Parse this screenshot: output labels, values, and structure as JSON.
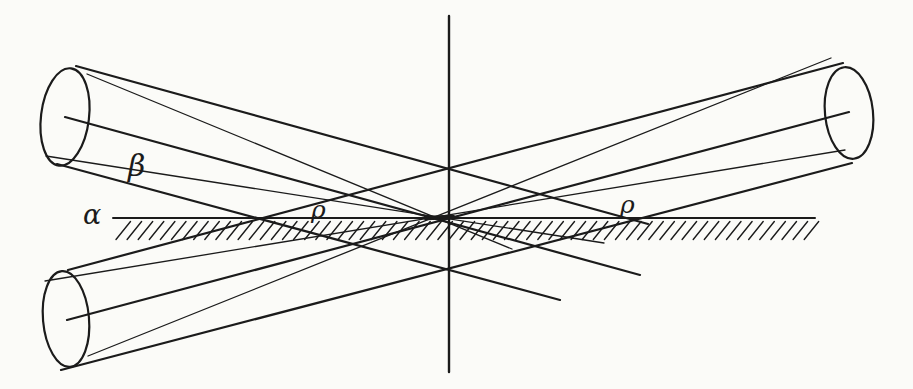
{
  "figure": {
    "background_color": "#fbfbf8",
    "ink_color": "#1b1b1b",
    "labels": {
      "alpha": "α",
      "beta": "β",
      "rho_left": "ρ",
      "rho_right": "ρ"
    },
    "canvas": {
      "width": 913,
      "height": 389
    },
    "lines": [
      {
        "id": "vertical-axis-line",
        "x1": 449,
        "y1": 16,
        "x2": 449,
        "y2": 372,
        "w": 2.4
      },
      {
        "id": "surface-line",
        "x1": 113,
        "y1": 218,
        "x2": 815,
        "y2": 218,
        "w": 2.0
      },
      {
        "id": "focus-segment",
        "x1": 426,
        "y1": 218,
        "x2": 453,
        "y2": 217,
        "w": 4.5
      },
      {
        "id": "beam1-top-edge",
        "x1": 76,
        "y1": 66,
        "x2": 648,
        "y2": 224,
        "w": 2.2
      },
      {
        "id": "beam1-axis",
        "x1": 65,
        "y1": 117,
        "x2": 640,
        "y2": 275,
        "w": 2.2
      },
      {
        "id": "beam1-bottom-edge",
        "x1": 57,
        "y1": 164,
        "x2": 560,
        "y2": 300,
        "w": 2.2
      },
      {
        "id": "beam1-ray-top",
        "x1": 87,
        "y1": 74,
        "x2": 512,
        "y2": 249,
        "w": 1.3
      },
      {
        "id": "beam1-ray-bottom",
        "x1": 46,
        "y1": 156,
        "x2": 604,
        "y2": 243,
        "w": 1.3
      },
      {
        "id": "beam2-top-edge",
        "x1": 68,
        "y1": 270,
        "x2": 843,
        "y2": 63,
        "w": 2.2
      },
      {
        "id": "beam2-axis",
        "x1": 67,
        "y1": 320,
        "x2": 849,
        "y2": 112,
        "w": 2.2
      },
      {
        "id": "beam2-bottom-edge",
        "x1": 61,
        "y1": 370,
        "x2": 852,
        "y2": 163,
        "w": 2.2
      },
      {
        "id": "beam2-ray-steep",
        "x1": 88,
        "y1": 356,
        "x2": 831,
        "y2": 58,
        "w": 1.3
      },
      {
        "id": "beam2-ray-shallow",
        "x1": 45,
        "y1": 281,
        "x2": 845,
        "y2": 150,
        "w": 1.3
      }
    ],
    "ellipses": [
      {
        "id": "upper-left-beam-cap",
        "cx": 65,
        "cy": 117,
        "rx": 24,
        "ry": 49,
        "rot": 7,
        "w": 2.2
      },
      {
        "id": "lower-left-beam-cap",
        "cx": 66,
        "cy": 319,
        "rx": 23,
        "ry": 48,
        "rot": -5,
        "w": 2.2
      },
      {
        "id": "upper-right-beam-cap",
        "cx": 849,
        "cy": 113,
        "rx": 24,
        "ry": 46,
        "rot": -6,
        "w": 2.2
      }
    ],
    "hatch": {
      "x_start": 116,
      "count": 63,
      "step": 11.1,
      "y_bottom": 239.5,
      "y_top": 221.5,
      "dx": 14.5,
      "w": 1.4
    },
    "label_positions": {
      "alpha": {
        "x": 83,
        "y": 224
      },
      "beta": {
        "x": 128,
        "y": 176
      },
      "rho_left": {
        "x": 311,
        "y": 218
      },
      "rho_right": {
        "x": 620,
        "y": 213
      }
    }
  }
}
